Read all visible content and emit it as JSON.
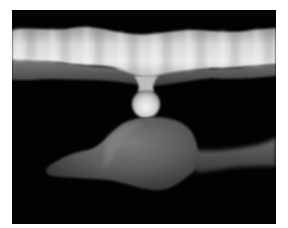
{
  "image": {
    "description": "Grayscale 3D render of a wavy upper membrane connected by a small bulbous stalk to a lower blob-shaped structure, on a black background",
    "background_color": "#020202",
    "border_color": "#ffffff",
    "colors": {
      "membrane_light": "#e6e6e6",
      "membrane_mid": "#b5b5b5",
      "membrane_shadow": "#6e6e6e",
      "stalk_light": "#f0f0f0",
      "stalk_mid": "#a8a8a8",
      "blob_light": "#7a7a7a",
      "blob_mid": "#5a5a5a",
      "blob_dark": "#333333"
    }
  }
}
